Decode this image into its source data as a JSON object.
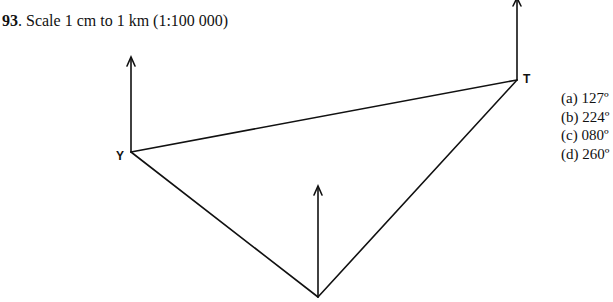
{
  "question": {
    "number": "93",
    "text": ". Scale 1 cm to 1 km (1:100 000)"
  },
  "diagram": {
    "points": [
      {
        "name": "Y",
        "label": "Y",
        "x": 131,
        "y": 152
      },
      {
        "name": "T",
        "label": "T",
        "x": 517,
        "y": 80
      },
      {
        "name": "bottom",
        "label": "",
        "x": 318,
        "y": 297
      }
    ],
    "north_arrows": [
      {
        "at": "Y",
        "x": 131,
        "y_top": 58,
        "y_bottom": 152
      },
      {
        "at": "T",
        "x": 517,
        "y_top": 0,
        "y_bottom": 80
      },
      {
        "at": "bottom",
        "x": 318,
        "y_top": 187,
        "y_bottom": 297
      }
    ],
    "lines": [
      {
        "from": "Y",
        "to": "T"
      },
      {
        "from": "Y",
        "to": "bottom"
      },
      {
        "from": "bottom",
        "to": "T"
      }
    ]
  },
  "options": [
    {
      "letter": "(a)",
      "value": "127º"
    },
    {
      "letter": "(b)",
      "value": "224º"
    },
    {
      "letter": "(c)",
      "value": "080º"
    },
    {
      "letter": "(d)",
      "value": "260º"
    }
  ]
}
